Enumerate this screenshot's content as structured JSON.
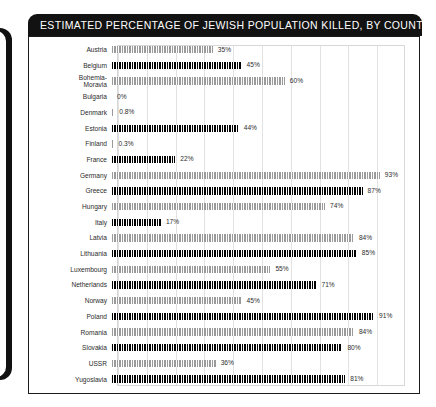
{
  "header": {
    "title": "ESTIMATED PERCENTAGE OF JEWISH POPULATION KILLED, BY COUNTRY"
  },
  "colors": {
    "header_background": "#121212",
    "header_text": "#ffffff",
    "bar_dark": "#000000",
    "bar_light": "#9a9a9a",
    "grid_line": "#e2e2e2",
    "frame_border": "#1b1b1b",
    "page_background": "#ffffff"
  },
  "chart_data": {
    "type": "bar",
    "orientation": "horizontal",
    "title": "ESTIMATED PERCENTAGE OF JEWISH POPULATION KILLED, BY COUNTRY",
    "xlabel": "",
    "ylabel": "",
    "xlim": [
      0,
      100
    ],
    "grid": true,
    "legend": false,
    "unit": "%",
    "categories": [
      "Austria",
      "Belgium",
      "Bohemia-\nMoravia",
      "Bulgaria",
      "Denmark",
      "Estonia",
      "Finland",
      "France",
      "Germany",
      "Greece",
      "Hungary",
      "Italy",
      "Latvia",
      "Lithuania",
      "Luxembourg",
      "Netherlands",
      "Norway",
      "Poland",
      "Romania",
      "Slovakia",
      "USSR",
      "Yugoslavia"
    ],
    "values": [
      35,
      45,
      60,
      0,
      0.8,
      44,
      0.3,
      22,
      93,
      87,
      74,
      17,
      84,
      85,
      55,
      71,
      45,
      91,
      84,
      80,
      36,
      81
    ],
    "labels": [
      "35%",
      "45%",
      "60%",
      "0%",
      "0.8%",
      "44%",
      "0.3%",
      "22%",
      "93%",
      "87%",
      "74%",
      "17%",
      "84%",
      "85%",
      "55%",
      "71%",
      "45%",
      "91%",
      "84%",
      "80%",
      "36%",
      "81%"
    ],
    "bar_styles": [
      "light",
      "dark",
      "light",
      "dark",
      "light",
      "dark",
      "light",
      "dark",
      "light",
      "dark",
      "light",
      "dark",
      "light",
      "dark",
      "light",
      "dark",
      "light",
      "dark",
      "light",
      "dark",
      "light",
      "dark"
    ]
  }
}
